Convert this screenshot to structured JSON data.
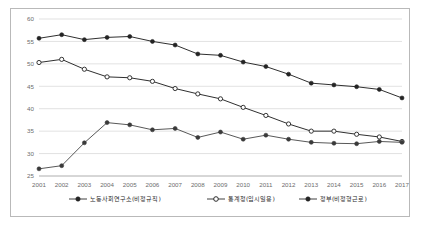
{
  "chart_data": {
    "type": "line",
    "title": "",
    "subtitle": "",
    "xlabel": "",
    "ylabel": "",
    "grid": "horizontal",
    "legend_position": "bottom",
    "xlim": [
      2001,
      2017
    ],
    "ylim": [
      25,
      60
    ],
    "yticks": [
      25,
      30,
      35,
      40,
      45,
      50,
      55,
      60
    ],
    "categories": [
      2001,
      2002,
      2003,
      2004,
      2005,
      2006,
      2007,
      2008,
      2009,
      2010,
      2011,
      2012,
      2013,
      2014,
      2015,
      2016,
      2017
    ],
    "xtick_labels": [
      "2001",
      "2002",
      "2003",
      "2004",
      "2005",
      "2006",
      "2007",
      "2008",
      "2009",
      "2010",
      "2011",
      "2012",
      "2013",
      "2014",
      "2015",
      "2016",
      "2017"
    ],
    "ytick_labels": [
      "25",
      "30",
      "35",
      "40",
      "45",
      "50",
      "55",
      "60"
    ],
    "series": [
      {
        "name": "노동사회연구소(비정규직)",
        "marker": "filled-circle",
        "color": "#242424",
        "values": [
          55.7,
          56.5,
          55.4,
          55.9,
          56.1,
          55.0,
          54.2,
          52.2,
          51.9,
          50.4,
          49.4,
          47.7,
          45.7,
          45.3,
          44.9,
          44.3,
          42.4
        ]
      },
      {
        "name": "통계청(임시일용)",
        "marker": "open-circle",
        "color": "#2b2b2b",
        "values": [
          50.3,
          51.0,
          48.8,
          47.1,
          46.9,
          46.1,
          44.5,
          43.3,
          42.2,
          40.3,
          38.5,
          36.6,
          35.0,
          35.0,
          34.3,
          33.7,
          32.7
        ]
      },
      {
        "name": "정부(비정형근로)",
        "marker": "filled-circle",
        "color": "#3a3a3a",
        "values": [
          26.6,
          27.3,
          32.4,
          36.9,
          36.4,
          35.3,
          35.6,
          33.6,
          34.8,
          33.2,
          34.1,
          33.2,
          32.5,
          32.3,
          32.2,
          32.7,
          32.5
        ]
      }
    ],
    "legend": [
      {
        "label": "노동사회연구소(비정규직)",
        "marker": "filled-circle"
      },
      {
        "label": "통계청(임시일용)",
        "marker": "open-circle"
      },
      {
        "label": "정부(비정형근로)",
        "marker": "filled-circle"
      }
    ]
  }
}
